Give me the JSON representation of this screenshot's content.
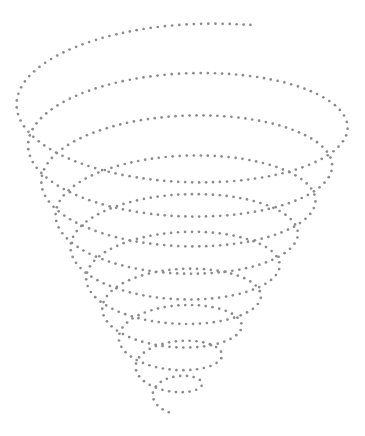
{
  "figure": {
    "width": 365,
    "height": 436,
    "background": "#ffffff",
    "dot_color": "#8c8c8c",
    "dot_radius": 1.35,
    "dot_spacing": 6.8,
    "spiral": {
      "turns": 9.6,
      "start_angle_deg": -68,
      "top": {
        "cx": 186,
        "cy": 88,
        "rx": 172,
        "ry": 68
      },
      "bottom": {
        "cx": 172,
        "cy": 405,
        "rx": 14,
        "ry": 9
      },
      "radius_exponent": 1.15,
      "y_exponent": 0.85
    }
  }
}
